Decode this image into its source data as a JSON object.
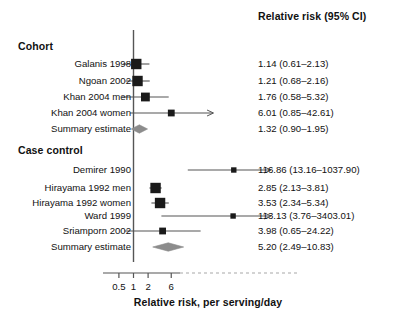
{
  "figure": {
    "column_header": "Relative risk (95% CI)",
    "x_axis_title": "Relative risk, per serving/day",
    "x_ticks": [
      "0.5",
      "1",
      "2",
      "6"
    ],
    "x_tick_values": [
      0.5,
      1,
      2,
      6
    ],
    "reference_line_value": 1,
    "colors": {
      "marker": "#1a1a1a",
      "line": "#555555",
      "diamond": "#8c8c8c",
      "axis": "#555555",
      "dashed_axis": "#a8a8a8",
      "text": "#111111"
    }
  },
  "chart_data": {
    "type": "forest",
    "title": "",
    "xlabel": "Relative risk, per serving/day",
    "ylabel": "",
    "xscale": "log",
    "xlim": [
      0.4,
      100
    ],
    "grid": false,
    "reference_line": 1,
    "tick_labels": [
      "0.5",
      "1",
      "2",
      "6"
    ],
    "tick_values": [
      0.5,
      1,
      2,
      6
    ],
    "effect_header": "Relative risk (95% CI)",
    "groups": [
      {
        "name": "Cohort",
        "rows": [
          {
            "label": "Galanis 1998",
            "estimate": 1.14,
            "lower": 0.61,
            "upper": 2.13,
            "text": "1.14 (0.61–2.13)",
            "type": "study",
            "weight": "large",
            "truncated_right": false
          },
          {
            "label": "Ngoan 2002",
            "estimate": 1.21,
            "lower": 0.68,
            "upper": 2.16,
            "text": "1.21 (0.68–2.16)",
            "type": "study",
            "weight": "large",
            "truncated_right": false
          },
          {
            "label": "Khan 2004 men",
            "estimate": 1.76,
            "lower": 0.58,
            "upper": 5.32,
            "text": "1.76 (0.58–5.32)",
            "type": "study",
            "weight": "medium",
            "truncated_right": false
          },
          {
            "label": "Khan 2004 women",
            "estimate": 6.01,
            "lower": 0.85,
            "upper": 42.61,
            "text": "6.01 (0.85–42.61)",
            "type": "study",
            "weight": "small",
            "truncated_right": true
          },
          {
            "label": "Summary estimate",
            "estimate": 1.32,
            "lower": 0.9,
            "upper": 1.95,
            "text": "1.32 (0.90–1.95)",
            "type": "summary",
            "weight": "diamond",
            "truncated_right": false
          }
        ]
      },
      {
        "name": "Case control",
        "rows": [
          {
            "label": "Demirer 1990",
            "estimate": 116.86,
            "lower": 13.16,
            "upper": 1037.9,
            "text": "116.86 (13.16–1037.90)",
            "type": "study",
            "weight": "xsmall",
            "truncated_right": true
          },
          {
            "label": "Hirayama 1992 men",
            "estimate": 2.85,
            "lower": 2.13,
            "upper": 3.81,
            "text": "2.85 (2.13–3.81)",
            "type": "study",
            "weight": "large",
            "truncated_right": false
          },
          {
            "label": "Hirayama 1992 women",
            "estimate": 3.53,
            "lower": 2.34,
            "upper": 5.34,
            "text": "3.53 (2.34–5.34)",
            "type": "study",
            "weight": "large",
            "truncated_right": false
          },
          {
            "label": "Ward 1999",
            "estimate": 113.13,
            "lower": 3.76,
            "upper": 3403.01,
            "text": "113.13 (3.76–3403.01)",
            "type": "study",
            "weight": "xsmall",
            "truncated_right": true
          },
          {
            "label": "Sriamporn 2002",
            "estimate": 3.98,
            "lower": 0.65,
            "upper": 24.22,
            "text": "3.98 (0.65–24.22)",
            "type": "study",
            "weight": "small",
            "truncated_right": false
          },
          {
            "label": "Summary estimate",
            "estimate": 5.2,
            "lower": 2.49,
            "upper": 10.83,
            "text": "5.20 (2.49–10.83)",
            "type": "summary",
            "weight": "diamond",
            "truncated_right": false
          }
        ]
      }
    ]
  },
  "layout": {
    "rows_y": {
      "Cohort_head": 48,
      "Galanis 1998": 64,
      "Ngoan 2002": 81,
      "Khan 2004 men": 97,
      "Khan 2004 women": 113,
      "Summary estimate A": 129,
      "Case control_head": 152,
      "Demirer 1990": 170,
      "Hirayama 1992 men": 188,
      "Hirayama 1992 women": 203,
      "Ward 1999": 216,
      "Sriamporn 2002": 231,
      "Summary estimate B": 247
    }
  }
}
